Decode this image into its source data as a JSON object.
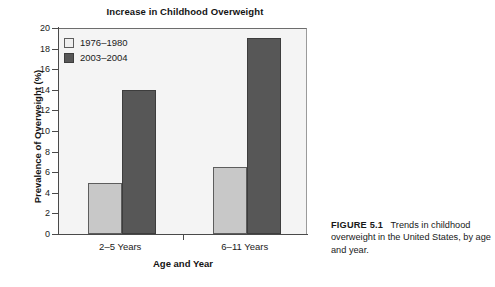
{
  "chart_data": {
    "type": "bar",
    "title": "Increase in Childhood Overweight",
    "xlabel": "Age and Year",
    "ylabel": "Prevalence of Overweight (%)",
    "categories": [
      "2–5 Years",
      "6–11 Years"
    ],
    "series": [
      {
        "name": "1976–1980",
        "values": [
          5.0,
          6.5
        ],
        "color": "#c8c8c8"
      },
      {
        "name": "2003–2004",
        "values": [
          14.0,
          19.0
        ],
        "color": "#575757"
      }
    ],
    "ylim": [
      0,
      20
    ],
    "yticks": [
      0,
      2,
      4,
      6,
      8,
      10,
      12,
      14,
      16,
      18,
      20
    ],
    "ytick_labels": [
      "0",
      "2",
      "4",
      "6",
      "8",
      "10",
      "12",
      "14",
      "16",
      "18",
      "20"
    ],
    "grid": false,
    "legend_position": "upper left"
  },
  "caption": {
    "label": "FIGURE 5.1",
    "text": "Trends in childhood overweight in the United States, by age and year."
  }
}
